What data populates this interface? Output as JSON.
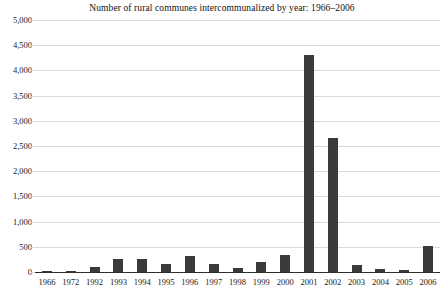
{
  "chart_data": {
    "type": "bar",
    "title": "Number of rural communes intercommunalized by year: 1966–2006",
    "xlabel": "",
    "ylabel": "",
    "categories": [
      "1966",
      "1972",
      "1992",
      "1993",
      "1994",
      "1995",
      "1996",
      "1997",
      "1998",
      "1999",
      "2000",
      "2001",
      "2002",
      "2003",
      "2004",
      "2005",
      "2006"
    ],
    "values": [
      30,
      10,
      100,
      250,
      250,
      160,
      310,
      150,
      80,
      200,
      330,
      4300,
      2660,
      130,
      60,
      35,
      520
    ],
    "ylim": [
      0,
      5000
    ],
    "ytick_labels": [
      "5,000",
      "4,500",
      "4,000",
      "3,500",
      "3,000",
      "2,500",
      "2,000",
      "1,500",
      "1,000",
      "500",
      "0"
    ],
    "ytick_values": [
      5000,
      4500,
      4000,
      3500,
      3000,
      2500,
      2000,
      1500,
      1000,
      500,
      0
    ],
    "grid": true,
    "legend": "none",
    "bar_color": "#3a3a3a",
    "grid_color": "#d9d9d9",
    "axis_color": "#2e2e2e"
  }
}
